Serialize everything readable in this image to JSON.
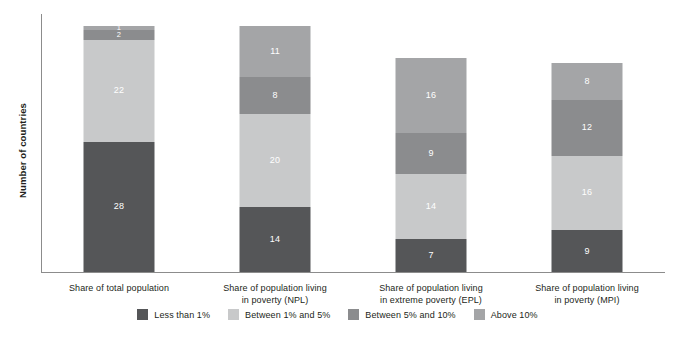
{
  "chart_data": {
    "type": "bar",
    "title": "",
    "subtitle": "",
    "xlabel": "",
    "ylabel": "Number of countries",
    "stacked": true,
    "grid": false,
    "legend_position": "bottom",
    "ylim": [
      0,
      55
    ],
    "categories": [
      "Share of total population",
      "Share of population living in poverty (NPL)",
      "Share of population living in extreme poverty (EPL)",
      "Share of population living in poverty (MPI)"
    ],
    "category_lines": [
      [
        "Share of total population",
        ""
      ],
      [
        "Share of population living",
        "in poverty (NPL)"
      ],
      [
        "Share of population living",
        "in extreme poverty (EPL)"
      ],
      [
        "Share of population living",
        "in poverty (MPI)"
      ]
    ],
    "series": [
      {
        "name": "Less than 1%",
        "color": "#555658",
        "values": [
          28,
          14,
          7,
          9
        ]
      },
      {
        "name": "Between 1% and 5%",
        "color": "#c8c9ca",
        "values": [
          22,
          20,
          14,
          16
        ]
      },
      {
        "name": "Between 5% and 10%",
        "color": "#8b8c8e",
        "values": [
          2,
          8,
          9,
          12
        ]
      },
      {
        "name": "Above 10%",
        "color": "#a4a5a7",
        "values": [
          1,
          11,
          16,
          8
        ]
      }
    ],
    "totals": [
      53,
      53,
      46,
      45
    ]
  },
  "axis": {
    "y_title": "Number of countries"
  },
  "bars": [
    {
      "label_line1": "Share of total population",
      "label_line2": "",
      "segments": [
        {
          "name": "Less than 1%",
          "value": "28",
          "color": "#555658"
        },
        {
          "name": "Between 1% and 5%",
          "value": "22",
          "color": "#c8c9ca"
        },
        {
          "name": "Between 5% and 10%",
          "value": "2",
          "color": "#8b8c8e"
        },
        {
          "name": "Above 10%",
          "value": "1",
          "color": "#a4a5a7"
        }
      ]
    },
    {
      "label_line1": "Share of population living",
      "label_line2": "in poverty (NPL)",
      "segments": [
        {
          "name": "Less than 1%",
          "value": "14",
          "color": "#555658"
        },
        {
          "name": "Between 1% and 5%",
          "value": "20",
          "color": "#c8c9ca"
        },
        {
          "name": "Between 5% and 10%",
          "value": "8",
          "color": "#8b8c8e"
        },
        {
          "name": "Above 10%",
          "value": "11",
          "color": "#a4a5a7"
        }
      ]
    },
    {
      "label_line1": "Share of population living",
      "label_line2": "in extreme poverty (EPL)",
      "segments": [
        {
          "name": "Less than 1%",
          "value": "7",
          "color": "#555658"
        },
        {
          "name": "Between 1% and 5%",
          "value": "14",
          "color": "#c8c9ca"
        },
        {
          "name": "Between 5% and 10%",
          "value": "9",
          "color": "#8b8c8e"
        },
        {
          "name": "Above 10%",
          "value": "16",
          "color": "#a4a5a7"
        }
      ]
    },
    {
      "label_line1": "Share of population living",
      "label_line2": "in poverty (MPI)",
      "segments": [
        {
          "name": "Less than 1%",
          "value": "9",
          "color": "#555658"
        },
        {
          "name": "Between 1% and 5%",
          "value": "16",
          "color": "#c8c9ca"
        },
        {
          "name": "Between 5% and 10%",
          "value": "12",
          "color": "#8b8c8e"
        },
        {
          "name": "Above 10%",
          "value": "8",
          "color": "#a4a5a7"
        }
      ]
    }
  ],
  "legend": [
    {
      "label": "Less than 1%",
      "color": "#555658"
    },
    {
      "label": "Between 1% and 5%",
      "color": "#c8c9ca"
    },
    {
      "label": "Between 5% and 10%",
      "color": "#8b8c8e"
    },
    {
      "label": "Above 10%",
      "color": "#a4a5a7"
    }
  ]
}
